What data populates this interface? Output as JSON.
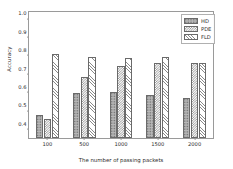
{
  "chart_data": {
    "type": "bar",
    "title": "",
    "xlabel": "The number of passing packets",
    "ylabel": "Accuracy",
    "categories": [
      "100",
      "500",
      "1000",
      "1500",
      "2000"
    ],
    "series": [
      {
        "name": "HD",
        "fill": "stipple",
        "values": [
          0.48,
          0.6,
          0.605,
          0.59,
          0.57
        ]
      },
      {
        "name": "PDE",
        "fill": "checkerboard",
        "values": [
          0.46,
          0.685,
          0.748,
          0.763,
          0.762
        ]
      },
      {
        "name": "FLD",
        "fill": "diagonal-hatch",
        "values": [
          0.81,
          0.793,
          0.788,
          0.795,
          0.763
        ]
      }
    ],
    "ylim": [
      0.355,
      1.04
    ],
    "yticks": [
      "0.4",
      "0.5",
      "0.6",
      "0.7",
      "0.8",
      "0.9",
      "1.0"
    ],
    "ytick_values": [
      0.4,
      0.5,
      0.6,
      0.7,
      0.8,
      0.9,
      1.0
    ],
    "grid": false,
    "legend_position": "upper-right",
    "legend_entries": [
      "HD",
      "PDE",
      "FLD"
    ],
    "colors": {
      "hd": "#b9b9b9",
      "pde": "#ffffff",
      "fld": "#ffffff",
      "edge": "#6a6a6a",
      "axis": "#9a9a9a",
      "text": "#2b2b2b"
    }
  }
}
